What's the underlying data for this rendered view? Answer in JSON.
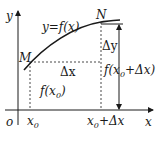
{
  "diagram": {
    "axes": {
      "x_label": "x",
      "y_label": "y",
      "origin_label": "o"
    },
    "curve_label": "y=f(x)",
    "points": [
      {
        "name": "M",
        "label": "M"
      },
      {
        "name": "N",
        "label": "N"
      }
    ],
    "labels": {
      "delta_x": "Δx",
      "delta_y": "Δy",
      "f_x0": "f(x",
      "f_x0_sub": "0",
      "f_x0_close": ")",
      "f_x0dx": "f(x",
      "f_x0dx_sub": "0",
      "f_x0dx_rest": "+Δx)",
      "x0": "x",
      "x0_sub": "0",
      "x0dx": "x",
      "x0dx_sub": "0",
      "x0dx_rest": "+Δx"
    },
    "colors": {
      "stroke": "#1a1a1a",
      "background": "#ffffff"
    }
  }
}
